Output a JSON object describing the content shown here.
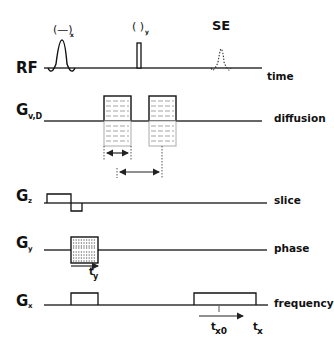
{
  "diagram": {
    "type": "MRI pulse sequence timing diagram",
    "rows": [
      {
        "id": "rf",
        "label": "RF",
        "sub": "",
        "right_label": "time"
      },
      {
        "id": "gvd",
        "label": "G",
        "sub": "v,D",
        "right_label": "diffusion"
      },
      {
        "id": "gz",
        "label": "G",
        "sub": "z",
        "right_label": "slice"
      },
      {
        "id": "gy",
        "label": "G",
        "sub": "y",
        "right_label": "phase"
      },
      {
        "id": "gx",
        "label": "G",
        "sub": "x",
        "right_label": "frequency"
      }
    ],
    "rf_pulses": [
      {
        "label": "(—)",
        "sub": "x",
        "kind": "sinc excitation pulse"
      },
      {
        "label": "(  )",
        "sub": "y",
        "kind": "refocusing pulse"
      }
    ],
    "echo": {
      "label": "SE",
      "kind": "spin echo (dotted)"
    },
    "annotations": {
      "ty": {
        "main": "t",
        "sub": "y"
      },
      "tx0": {
        "main": "t",
        "sub": "x0"
      },
      "tx": {
        "main": "t",
        "sub": "x"
      }
    }
  }
}
